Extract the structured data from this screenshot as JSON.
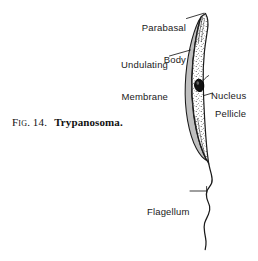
{
  "figure": {
    "caption": {
      "fig_word": "Fig.",
      "fig_number": "14.",
      "subject": "Trypanosoma."
    },
    "labels": [
      {
        "id": "parabasal-body",
        "line1": "Parabasal",
        "line2": "Body"
      },
      {
        "id": "undulating-membrane",
        "line1": "Undulating",
        "line2": "Membrane"
      },
      {
        "id": "nucleus",
        "line1": "Nucleus",
        "line2": ""
      },
      {
        "id": "pellicle",
        "line1": "Pellicle",
        "line2": ""
      },
      {
        "id": "flagellum",
        "line1": "Flagellum",
        "line2": ""
      }
    ],
    "colors": {
      "ink": "#1a1a1a",
      "background": "#ffffff",
      "membrane_shade": "#6e6e6e",
      "nucleus_fill": "#111111",
      "stipple": "#2b2b2b"
    }
  }
}
